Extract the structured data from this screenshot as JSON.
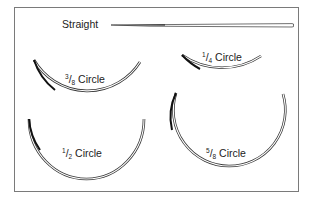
{
  "diagram": {
    "needles": [
      {
        "id": "straight",
        "label": "Straight"
      },
      {
        "id": "three-eighths",
        "label_num": "3",
        "label_den": "8",
        "label_word": "Circle"
      },
      {
        "id": "one-quarter",
        "label_num": "1",
        "label_den": "4",
        "label_word": "Circle"
      },
      {
        "id": "one-half",
        "label_num": "1",
        "label_den": "2",
        "label_word": "Circle"
      },
      {
        "id": "five-eighths",
        "label_num": "5",
        "label_den": "8",
        "label_word": "Circle"
      }
    ],
    "colors": {
      "frame": "#7a7a7a",
      "needle": "#222222",
      "label": "#222222"
    }
  }
}
